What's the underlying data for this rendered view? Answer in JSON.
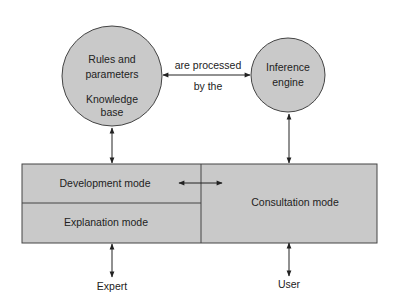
{
  "colors": {
    "node_fill": "#c9c9c9",
    "stroke": "#333333",
    "text": "#222222",
    "background": "#ffffff"
  },
  "nodes": {
    "knowledge_base": {
      "line1": "Rules and",
      "line2": "parameters",
      "line3": "Knowledge",
      "line4": "base"
    },
    "inference_engine": {
      "line1": "Inference",
      "line2": "engine"
    }
  },
  "edge_label": {
    "top": "are processed",
    "bottom": "by the"
  },
  "modes": {
    "development": "Development mode",
    "explanation": "Explanation mode",
    "consultation": "Consultation mode"
  },
  "actors": {
    "expert": "Expert",
    "user": "User"
  }
}
